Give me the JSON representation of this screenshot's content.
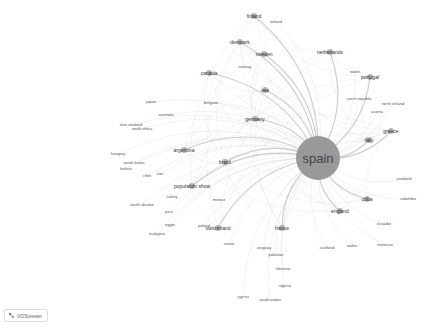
{
  "app": {
    "name": "VOSviewer",
    "badge_label": "VOSviewer"
  },
  "network": {
    "center": {
      "label": "spain",
      "x": 318,
      "y": 158,
      "r": 22
    },
    "nodes": [
      {
        "label": "finland",
        "x": 254,
        "y": 16,
        "size": "mid"
      },
      {
        "label": "ireland",
        "x": 276,
        "y": 22,
        "size": "small"
      },
      {
        "label": "denmark",
        "x": 240,
        "y": 42,
        "size": "mid"
      },
      {
        "label": "sweden",
        "x": 264,
        "y": 54,
        "size": "mid"
      },
      {
        "label": "netherlands",
        "x": 330,
        "y": 52,
        "size": "mid"
      },
      {
        "label": "norway",
        "x": 245,
        "y": 67,
        "size": "small"
      },
      {
        "label": "canada",
        "x": 209,
        "y": 73,
        "size": "mid"
      },
      {
        "label": "usa",
        "x": 265,
        "y": 90,
        "size": "mid"
      },
      {
        "label": "portugal",
        "x": 370,
        "y": 77,
        "size": "mid"
      },
      {
        "label": "wales",
        "x": 355,
        "y": 72,
        "size": "small"
      },
      {
        "label": "japan",
        "x": 151,
        "y": 102,
        "size": "small"
      },
      {
        "label": "belgium",
        "x": 211,
        "y": 103,
        "size": "small"
      },
      {
        "label": "australia",
        "x": 166,
        "y": 115,
        "size": "small"
      },
      {
        "label": "czech republic",
        "x": 359,
        "y": 99,
        "size": "small"
      },
      {
        "label": "north ireland",
        "x": 393,
        "y": 104,
        "size": "small"
      },
      {
        "label": "austria",
        "x": 377,
        "y": 112,
        "size": "small"
      },
      {
        "label": "germany",
        "x": 255,
        "y": 119,
        "size": "mid"
      },
      {
        "label": "new zealand",
        "x": 131,
        "y": 125,
        "size": "small"
      },
      {
        "label": "south africa",
        "x": 142,
        "y": 129,
        "size": "small"
      },
      {
        "label": "greece",
        "x": 391,
        "y": 131,
        "size": "mid"
      },
      {
        "label": "italy",
        "x": 369,
        "y": 140,
        "size": "mid"
      },
      {
        "label": "argentina",
        "x": 184,
        "y": 150,
        "size": "mid"
      },
      {
        "label": "brazil",
        "x": 225,
        "y": 162,
        "size": "mid"
      },
      {
        "label": "hungary",
        "x": 118,
        "y": 154,
        "size": "small"
      },
      {
        "label": "south korea",
        "x": 134,
        "y": 163,
        "size": "small"
      },
      {
        "label": "bolivia",
        "x": 126,
        "y": 169,
        "size": "small"
      },
      {
        "label": "iran",
        "x": 160,
        "y": 174,
        "size": "small"
      },
      {
        "label": "chile",
        "x": 147,
        "y": 176,
        "size": "small"
      },
      {
        "label": "population show",
        "x": 192,
        "y": 186,
        "size": "mid"
      },
      {
        "label": "scotland",
        "x": 404,
        "y": 179,
        "size": "small"
      },
      {
        "label": "turkey",
        "x": 172,
        "y": 197,
        "size": "small"
      },
      {
        "label": "mexico",
        "x": 219,
        "y": 200,
        "size": "small"
      },
      {
        "label": "colombia",
        "x": 408,
        "y": 199,
        "size": "small"
      },
      {
        "label": "cuba",
        "x": 367,
        "y": 199,
        "size": "mid"
      },
      {
        "label": "south ukraine",
        "x": 142,
        "y": 205,
        "size": "small"
      },
      {
        "label": "england",
        "x": 340,
        "y": 211,
        "size": "mid"
      },
      {
        "label": "peru",
        "x": 169,
        "y": 212,
        "size": "small"
      },
      {
        "label": "switzerland",
        "x": 218,
        "y": 228,
        "size": "mid"
      },
      {
        "label": "poland",
        "x": 204,
        "y": 226,
        "size": "small"
      },
      {
        "label": "ecuador",
        "x": 384,
        "y": 224,
        "size": "small"
      },
      {
        "label": "egypt",
        "x": 170,
        "y": 225,
        "size": "small"
      },
      {
        "label": "malaysia",
        "x": 157,
        "y": 234,
        "size": "small"
      },
      {
        "label": "france",
        "x": 282,
        "y": 228,
        "size": "mid"
      },
      {
        "label": "russia",
        "x": 229,
        "y": 244,
        "size": "small"
      },
      {
        "label": "uruguay",
        "x": 264,
        "y": 248,
        "size": "small"
      },
      {
        "label": "scotland2",
        "display": "scotland",
        "x": 327,
        "y": 248,
        "size": "small"
      },
      {
        "label": "wales2",
        "display": "wales",
        "x": 352,
        "y": 246,
        "size": "small"
      },
      {
        "label": "morocco",
        "x": 385,
        "y": 245,
        "size": "small"
      },
      {
        "label": "pakistan",
        "x": 276,
        "y": 255,
        "size": "small"
      },
      {
        "label": "slovenia",
        "x": 283,
        "y": 269,
        "size": "small"
      },
      {
        "label": "algeria",
        "x": 285,
        "y": 286,
        "size": "small"
      },
      {
        "label": "cyprus",
        "x": 243,
        "y": 297,
        "size": "small"
      },
      {
        "label": "saudi arabia",
        "x": 270,
        "y": 300,
        "size": "small"
      }
    ]
  }
}
